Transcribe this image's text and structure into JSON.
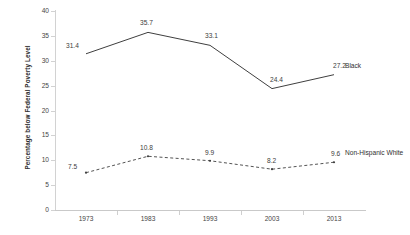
{
  "chart_data": {
    "type": "line",
    "title": "",
    "xlabel": "",
    "ylabel": "Percentage below Federal Poverty Level",
    "categories": [
      "1973",
      "1983",
      "1993",
      "2003",
      "2013"
    ],
    "ylim": [
      0,
      40
    ],
    "yticks": [
      "0",
      "5",
      "10",
      "15",
      "20",
      "25",
      "30",
      "35",
      "40"
    ],
    "grid": false,
    "legend_position": "right-inline-end-of-line",
    "series": [
      {
        "name": "Black",
        "style": "solid",
        "color": "#3f3f3f",
        "values": [
          31.4,
          35.7,
          33.1,
          24.4,
          27.2
        ],
        "labels": [
          "31.4",
          "35.7",
          "33.1",
          "24.4",
          "27.2"
        ]
      },
      {
        "name": "Non-Hispanic White",
        "style": "dashed",
        "color": "#3f3f3f",
        "values": [
          7.5,
          10.8,
          9.9,
          8.2,
          9.6
        ],
        "labels": [
          "7.5",
          "10.8",
          "9.9",
          "8.2",
          "9.6"
        ]
      }
    ]
  }
}
